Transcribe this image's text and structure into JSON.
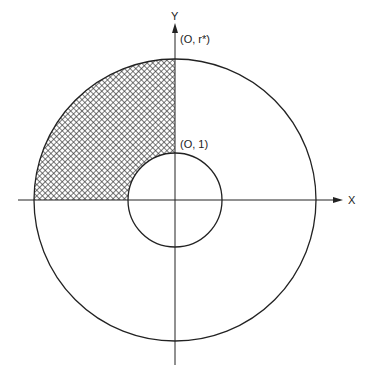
{
  "diagram": {
    "axes": {
      "x_label": "X",
      "y_label": "Y"
    },
    "points": {
      "outer_top_label": "(O, r*)",
      "inner_top_label": "(O, 1)"
    },
    "geometry": {
      "center": [
        175,
        200
      ],
      "outer_radius": 141,
      "inner_radius": 47
    },
    "shaded_region": "second quadrant between inner and outer circles, crosshatched",
    "colors": {
      "stroke": "#222222",
      "background": "#ffffff"
    }
  }
}
